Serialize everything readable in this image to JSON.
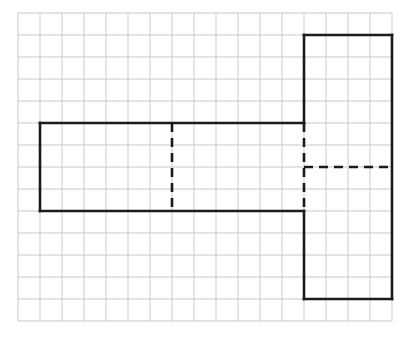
{
  "page": {
    "partial_caption_text": ""
  },
  "colors": {
    "background": "#ffffff",
    "grid_line": "#c9c9c9",
    "shape_stroke": "#1a1a1a",
    "fold_line": "#1a1a1a"
  },
  "grid": {
    "name": "square-grid",
    "origin_x": 18,
    "origin_y": 13,
    "cell_size": 22,
    "columns": 17,
    "rows": 14,
    "line_width": 1
  },
  "figure": {
    "name": "net-outline",
    "stroke_width": 2.6,
    "outline_points_grid": [
      [
        1,
        5
      ],
      [
        13,
        5
      ],
      [
        13,
        1
      ],
      [
        17,
        1
      ],
      [
        17,
        13
      ],
      [
        13,
        13
      ],
      [
        13,
        9
      ],
      [
        1,
        9
      ]
    ],
    "solid_segments_grid": [
      {
        "name": "left-rect-top",
        "from": [
          1,
          5
        ],
        "to": [
          13,
          5
        ]
      },
      {
        "name": "left-rect-left",
        "from": [
          1,
          5
        ],
        "to": [
          1,
          9
        ]
      },
      {
        "name": "left-rect-bottom",
        "from": [
          1,
          9
        ],
        "to": [
          13,
          9
        ]
      },
      {
        "name": "tall-rect-top",
        "from": [
          13,
          1
        ],
        "to": [
          17,
          1
        ]
      },
      {
        "name": "tall-rect-right",
        "from": [
          17,
          1
        ],
        "to": [
          17,
          13
        ]
      },
      {
        "name": "tall-rect-bottom",
        "from": [
          13,
          13
        ],
        "to": [
          17,
          13
        ]
      },
      {
        "name": "tall-rect-left-upper",
        "from": [
          13,
          1
        ],
        "to": [
          13,
          5
        ]
      },
      {
        "name": "tall-rect-left-lower",
        "from": [
          13,
          9
        ],
        "to": [
          13,
          13
        ]
      }
    ],
    "dashed_segments_grid": [
      {
        "name": "fold-vertical-mid",
        "from": [
          7,
          5
        ],
        "to": [
          7,
          9
        ]
      },
      {
        "name": "fold-vertical-junction",
        "from": [
          13,
          5
        ],
        "to": [
          13,
          9
        ]
      },
      {
        "name": "fold-horizontal-right",
        "from": [
          13,
          7
        ],
        "to": [
          17,
          7
        ]
      }
    ],
    "dash_pattern": "9 6"
  }
}
